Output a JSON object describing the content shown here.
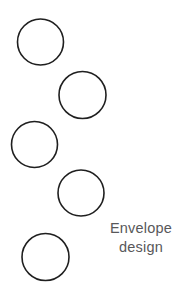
{
  "page": {
    "background_color": "#ffffff",
    "width": 186,
    "height": 295
  },
  "caption": {
    "line1": "Envelope",
    "line2": "design",
    "full_text": "Envelope design",
    "color": "#58585a",
    "align": "center"
  },
  "diagram": {
    "name": "envelope-design-circle-sketch",
    "stroke_color": "#1f1f1f",
    "fill_color": "none",
    "stroke_width": 1.6,
    "shape_type": "circle-outline",
    "count": 5,
    "circles": [
      {
        "label": "circle-1",
        "cx": 40.5,
        "cy": 42.0,
        "r": 23.0
      },
      {
        "label": "circle-2",
        "cx": 82.5,
        "cy": 95.0,
        "r": 23.5
      },
      {
        "label": "circle-3",
        "cx": 34.5,
        "cy": 144.5,
        "r": 23.0
      },
      {
        "label": "circle-4",
        "cx": 81.0,
        "cy": 193.0,
        "r": 23.0
      },
      {
        "label": "circle-5",
        "cx": 45.5,
        "cy": 257.0,
        "r": 23.5
      }
    ]
  }
}
